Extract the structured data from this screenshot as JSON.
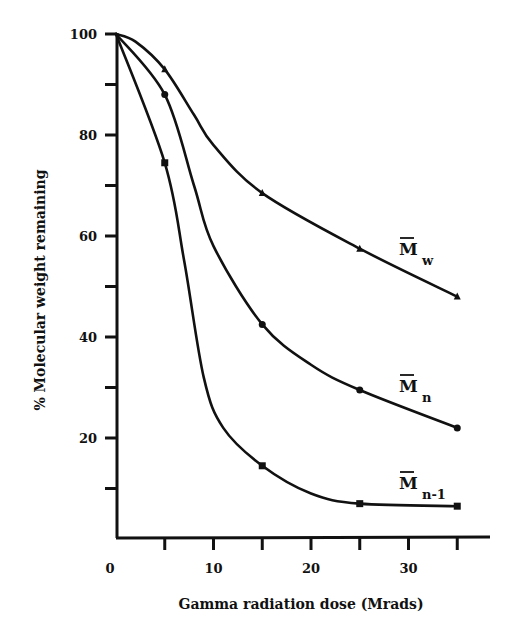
{
  "chart_data": {
    "type": "line",
    "title": "",
    "xlabel": "Gamma radiation dose (Mrads)",
    "ylabel": "% Molecular weight remaining",
    "xlim": [
      0,
      37
    ],
    "ylim": [
      0,
      100
    ],
    "x_ticks": [
      0,
      5,
      10,
      15,
      20,
      25,
      30,
      35
    ],
    "x_tick_labels": [
      "0",
      "10",
      "20",
      "30"
    ],
    "x_tick_label_values": [
      0,
      10,
      20,
      30
    ],
    "y_ticks": [
      10,
      20,
      30,
      40,
      50,
      60,
      70,
      80,
      90,
      100
    ],
    "y_tick_labels": [
      "20",
      "40",
      "60",
      "80",
      "100"
    ],
    "y_tick_label_values": [
      20,
      40,
      60,
      80,
      100
    ],
    "grid": false,
    "legend": "inline labels at right end of each curve",
    "x": [
      0,
      5,
      15,
      25,
      35
    ],
    "series": [
      {
        "name": "Mw",
        "label_main": "M",
        "label_sub": "w",
        "marker": "triangle",
        "values": [
          100,
          93,
          68.5,
          57.5,
          48
        ]
      },
      {
        "name": "Mn",
        "label_main": "M",
        "label_sub": "n",
        "marker": "circle",
        "values": [
          100,
          88,
          42.5,
          29.5,
          22
        ]
      },
      {
        "name": "Mn-1",
        "label_main": "M",
        "label_sub": "n-1",
        "marker": "square",
        "values": [
          100,
          74.5,
          14.5,
          7,
          6.5
        ]
      }
    ]
  }
}
